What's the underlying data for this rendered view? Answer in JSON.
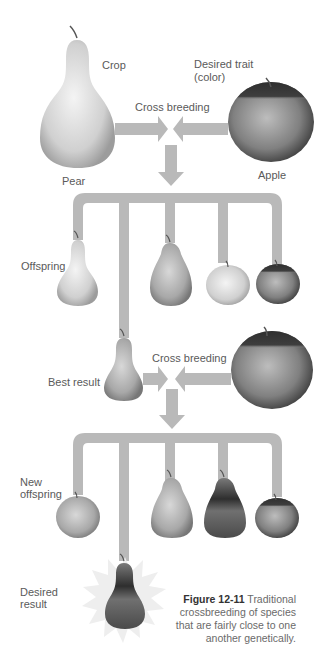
{
  "labels": {
    "crop": "Crop",
    "desired_trait_line1": "Desired trait",
    "desired_trait_line2": "(color)",
    "cross_breeding_1": "Cross breeding",
    "pear": "Pear",
    "apple": "Apple",
    "offspring": "Offspring",
    "best_result": "Best result",
    "cross_breeding_2": "Cross breeding",
    "new_offspring_line1": "New",
    "new_offspring_line2": "offspring",
    "desired_result_line1": "Desired",
    "desired_result_line2": "result"
  },
  "caption": {
    "figure_number": "Figure 12-11",
    "text": " Traditional crossbreeding of species that are fairly close to one another genetically."
  },
  "colors": {
    "connector": "#b9b9b9",
    "fruit_light": "#e6e6e6",
    "fruit_mid": "#a9a9a9",
    "fruit_dark": "#3a3a3a",
    "starburst": "#eeeeee"
  },
  "stages": [
    {
      "name": "parents",
      "items": [
        "Pear (crop)",
        "Apple (desired trait: color)"
      ]
    },
    {
      "name": "offspring",
      "items": [
        "light pear",
        "mid pear",
        "light apple",
        "dark apple",
        "best result pear"
      ]
    },
    {
      "name": "second cross",
      "items": [
        "Best result",
        "Apple"
      ]
    },
    {
      "name": "new offspring",
      "items": [
        "apple",
        "pear",
        "dark pear",
        "dark apple",
        "desired result pear"
      ]
    }
  ]
}
